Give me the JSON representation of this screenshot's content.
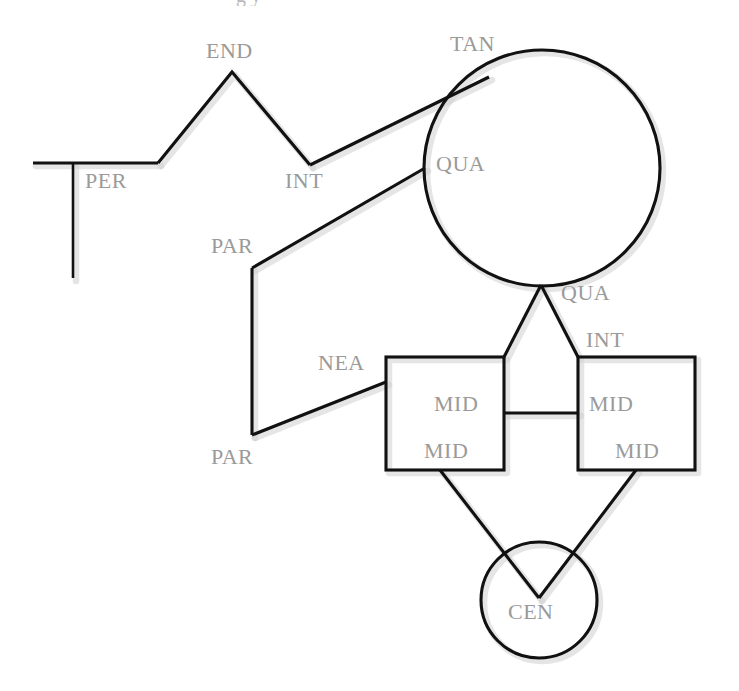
{
  "figure": {
    "background_color": "#ffffff",
    "stroke_color": "#111111",
    "label_color": "#9a9a9a",
    "shadow_color": "#cfcfcf",
    "width": 739,
    "height": 691,
    "partial_caption_above": "g  y"
  },
  "labels": [
    {
      "id": "end",
      "text": "END",
      "x": 206,
      "y": 40
    },
    {
      "id": "tan",
      "text": "TAN",
      "x": 450,
      "y": 33
    },
    {
      "id": "per",
      "text": "PER",
      "x": 85,
      "y": 170
    },
    {
      "id": "int_top",
      "text": "INT",
      "x": 285,
      "y": 170
    },
    {
      "id": "qua_left",
      "text": "QUA",
      "x": 436,
      "y": 153
    },
    {
      "id": "par_upper",
      "text": "PAR",
      "x": 211,
      "y": 235
    },
    {
      "id": "qua_bottom",
      "text": "QUA",
      "x": 561,
      "y": 282
    },
    {
      "id": "int_right",
      "text": "INT",
      "x": 586,
      "y": 329
    },
    {
      "id": "nea",
      "text": "NEA",
      "x": 318,
      "y": 352
    },
    {
      "id": "mid_left_upper",
      "text": "MID",
      "x": 434,
      "y": 393
    },
    {
      "id": "mid_right_upper",
      "text": "MID",
      "x": 589,
      "y": 393
    },
    {
      "id": "par_lower",
      "text": "PAR",
      "x": 211,
      "y": 446
    },
    {
      "id": "mid_left_lower",
      "text": "MID",
      "x": 424,
      "y": 440
    },
    {
      "id": "mid_right_lower",
      "text": "MID",
      "x": 615,
      "y": 440
    },
    {
      "id": "cen",
      "text": "CEN",
      "x": 508,
      "y": 601
    }
  ],
  "shapes": {
    "baseline": {
      "name": "horizontal-baseline",
      "x1": 33,
      "y1": 163,
      "x2": 158,
      "y2": 163
    },
    "perpendicular": {
      "name": "perpendicular-line",
      "x1": 73,
      "y1": 163,
      "x2": 73,
      "y2": 278
    },
    "zigzag": {
      "name": "zigzag-polyline",
      "points": "158,163 232,72 310,165"
    },
    "tangent_line": {
      "name": "tangent-line",
      "x1": 310,
      "y1": 165,
      "x2": 489,
      "y2": 77
    },
    "quadrant_line": {
      "name": "quadrant-line",
      "x1": 425,
      "y1": 168,
      "x2": 252,
      "y2": 268
    },
    "big_circle": {
      "name": "top-circle",
      "cx": 542,
      "cy": 168,
      "r": 118
    },
    "par_left_edge": {
      "name": "parallel-left-edge",
      "x1": 252,
      "y1": 268,
      "x2": 252,
      "y2": 435
    },
    "nea_line": {
      "name": "near-line",
      "x1": 252,
      "y1": 435,
      "x2": 386,
      "y2": 382
    },
    "triangle_left": {
      "name": "triangle-left-leg",
      "x1": 541,
      "y1": 285,
      "x2": 504,
      "y2": 357
    },
    "triangle_right": {
      "name": "triangle-right-leg",
      "x1": 541,
      "y1": 285,
      "x2": 578,
      "y2": 357
    },
    "left_square": {
      "name": "left-square",
      "x": 386,
      "y": 357,
      "w": 118,
      "h": 113
    },
    "right_square": {
      "name": "right-square",
      "x": 578,
      "y": 357,
      "w": 117,
      "h": 113
    },
    "mid_connector": {
      "name": "mid-connector-line",
      "x1": 504,
      "y1": 413,
      "x2": 578,
      "y2": 413
    },
    "cen_left_line": {
      "name": "center-left-line",
      "x1": 440,
      "y1": 470,
      "x2": 539,
      "y2": 598
    },
    "cen_right_line": {
      "name": "center-right-line",
      "x1": 636,
      "y1": 470,
      "x2": 539,
      "y2": 598
    },
    "cen_circle": {
      "name": "bottom-circle",
      "cx": 539,
      "cy": 600,
      "r": 58
    }
  }
}
